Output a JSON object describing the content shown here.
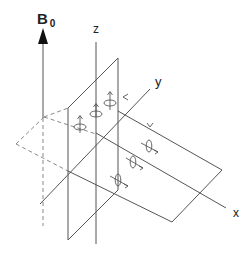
{
  "diagram": {
    "labels": {
      "field": "B",
      "field_subscript": "0",
      "z_axis": "z",
      "y_axis": "y",
      "x_axis": "x"
    },
    "elements": {
      "field_arrow": "B0 static magnetic field arrow pointing up",
      "vertical_plane": "yz plane (solid parallelogram)",
      "dashed_plane": "projected plane (dashed)",
      "horizontal_plane": "xy plane (solid parallelogram)",
      "spins_vertical": "3 precessing spins with moments pointing along +z",
      "spins_horizontal": "3 precessing spins with moments pointing along +x"
    },
    "colors": {
      "line": "#555555",
      "dashed": "#8a8a8a",
      "arrow_fill": "#111111",
      "text": "#222222"
    }
  }
}
